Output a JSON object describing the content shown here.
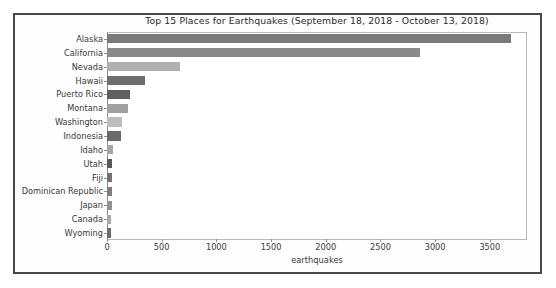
{
  "chart_data": {
    "type": "bar",
    "orientation": "horizontal",
    "title": "Top 15 Places for Earthquakes (September 18, 2018 - October 13, 2018)",
    "xlabel": "earthquakes",
    "ylabel": "",
    "categories": [
      "Alaska",
      "California",
      "Nevada",
      "Hawaii",
      "Puerto Rico",
      "Montana",
      "Washington",
      "Indonesia",
      "Idaho",
      "Utah",
      "Fiji",
      "Dominican Republic",
      "Japan",
      "Canada",
      "Wyoming"
    ],
    "values": [
      3690,
      2860,
      670,
      350,
      210,
      195,
      140,
      125,
      55,
      50,
      45,
      45,
      42,
      40,
      35
    ],
    "bar_colors": [
      "#7a7a7a",
      "#8a8a8a",
      "#b0b0b0",
      "#6e6e6e",
      "#5f5f5f",
      "#a0a0a0",
      "#bdbdbd",
      "#6a6a6a",
      "#a6a6a6",
      "#5a5a5a",
      "#717171",
      "#7d7d7d",
      "#929292",
      "#a9a9a9",
      "#6c6c6c"
    ],
    "xlim": [
      0,
      3840
    ],
    "ylim_categories": 15,
    "xticks": [
      0,
      500,
      1000,
      1500,
      2000,
      2500,
      3000,
      3500
    ],
    "xticklabels": [
      "0",
      "500",
      "1000",
      "1500",
      "2000",
      "2500",
      "3000",
      "3500"
    ],
    "grid": false,
    "legend": null
  }
}
